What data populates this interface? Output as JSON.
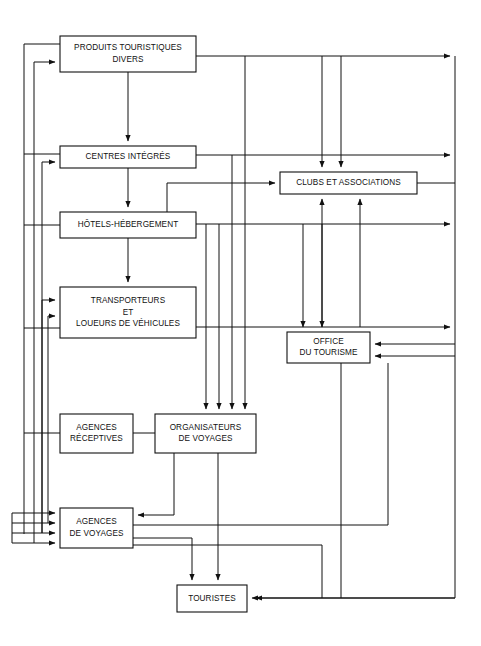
{
  "diagram": {
    "type": "flowchart",
    "background_color": "#ffffff",
    "line_color": "#111111",
    "box_fill": "#ffffff",
    "nodes": [
      {
        "id": "produits",
        "lines": [
          "PRODUITS TOURISTIQUES",
          "DIVERS"
        ],
        "x": 60,
        "y": 36,
        "w": 136,
        "h": 36
      },
      {
        "id": "centres",
        "lines": [
          "CENTRES INTÉGRÉS"
        ],
        "x": 60,
        "y": 146,
        "w": 136,
        "h": 22
      },
      {
        "id": "hotels",
        "lines": [
          "HÔTELS-HÉBERGEMENT"
        ],
        "x": 60,
        "y": 212,
        "w": 136,
        "h": 26
      },
      {
        "id": "transporteurs",
        "lines": [
          "TRANSPORTEURS",
          "ET",
          "LOUEURS DE VÉHICULES"
        ],
        "x": 60,
        "y": 287,
        "w": 136,
        "h": 51
      },
      {
        "id": "clubs",
        "lines": [
          "CLUBS ET ASSOCIATIONS"
        ],
        "x": 280,
        "y": 172,
        "w": 137,
        "h": 22
      },
      {
        "id": "office",
        "lines": [
          "OFFICE",
          "DU TOURISME"
        ],
        "x": 287,
        "y": 332,
        "w": 83,
        "h": 31
      },
      {
        "id": "receptives",
        "lines": [
          "AGENCES",
          "RÉCEPTIVES"
        ],
        "x": 60,
        "y": 414,
        "w": 73,
        "h": 39
      },
      {
        "id": "organisateurs",
        "lines": [
          "ORGANISATEURS",
          "DE VOYAGES"
        ],
        "x": 155,
        "y": 414,
        "w": 101,
        "h": 39
      },
      {
        "id": "agences",
        "lines": [
          "AGENCES",
          "DE VOYAGES"
        ],
        "x": 60,
        "y": 508,
        "w": 73,
        "h": 40
      },
      {
        "id": "touristes",
        "lines": [
          "TOURISTES"
        ],
        "x": 177,
        "y": 585,
        "w": 70,
        "h": 27
      }
    ],
    "connectors": [
      {
        "name": "produits-to-centres",
        "d": "M128,72 L128,141",
        "arrow": "end"
      },
      {
        "name": "centres-to-hotels",
        "d": "M128,168 L128,207",
        "arrow": "end"
      },
      {
        "name": "hotels-to-transporteurs",
        "d": "M128,238 L128,282",
        "arrow": "end"
      },
      {
        "name": "left-outer-bus-from-produits",
        "d": "M60,44 L24,44 L24,534",
        "arrow": "none"
      },
      {
        "name": "left-bus-centres-tap",
        "d": "M60,154 L24,154",
        "arrow": "none"
      },
      {
        "name": "left-bus-hotels-tap",
        "d": "M60,225 L24,225",
        "arrow": "none"
      },
      {
        "name": "left-bus-transporteurs-tap",
        "d": "M60,328 L24,328",
        "arrow": "none"
      },
      {
        "name": "left-bus-receptives-tap",
        "d": "M60,433 L24,433",
        "arrow": "none"
      },
      {
        "name": "left-inner-riser-to-produits",
        "d": "M34,543 L34,62 L55,62",
        "arrow": "end"
      },
      {
        "name": "left-inner-riser-to-centres",
        "d": "M42,533 L42,162 L55,162",
        "arrow": "end"
      },
      {
        "name": "left-inner-riser-to-transport-a",
        "d": "M42,533 L42,300 L55,300",
        "arrow": "end"
      },
      {
        "name": "left-inner-riser-to-transport-b",
        "d": "M48,523 L48,316 L55,316",
        "arrow": "end"
      },
      {
        "name": "agences-in-1",
        "d": "M12,513 L55,513",
        "arrow": "end"
      },
      {
        "name": "agences-in-2",
        "d": "M12,523 L55,523",
        "arrow": "end"
      },
      {
        "name": "agences-in-3",
        "d": "M12,533 L55,533",
        "arrow": "end"
      },
      {
        "name": "agences-in-4",
        "d": "M12,543 L55,543",
        "arrow": "end"
      },
      {
        "name": "agences-left-feed-riser",
        "d": "M12,513 L12,543",
        "arrow": "none"
      },
      {
        "name": "produits-right-to-far-right",
        "d": "M196,56 L450,56",
        "arrow": "end"
      },
      {
        "name": "centres-right-to-far-right",
        "d": "M196,155 L450,155",
        "arrow": "end"
      },
      {
        "name": "hotels-right-to-far-right",
        "d": "M196,224 L450,224",
        "arrow": "end"
      },
      {
        "name": "transporteurs-right-to-far-right",
        "d": "M196,327 L450,327",
        "arrow": "end"
      },
      {
        "name": "far-right-bus",
        "d": "M455,56 L455,598 L256,598",
        "arrow": "end"
      },
      {
        "name": "to-clubs-from-left-elbow",
        "d": "M167,183 L275,183",
        "arrow": "end"
      },
      {
        "name": "clubs-left-elbow-riser",
        "d": "M167,183 L167,224",
        "arrow": "none"
      },
      {
        "name": "down-into-clubs-a",
        "d": "M322,56 L322,167",
        "arrow": "end"
      },
      {
        "name": "down-into-clubs-b",
        "d": "M341,56 L341,167",
        "arrow": "end"
      },
      {
        "name": "up-into-clubs-a",
        "d": "M322,327 L322,199",
        "arrow": "end"
      },
      {
        "name": "up-into-clubs-b",
        "d": "M360,327 L360,199",
        "arrow": "end"
      },
      {
        "name": "down-into-office-a",
        "d": "M303,224 L303,327",
        "arrow": "end"
      },
      {
        "name": "down-into-office-b",
        "d": "M322,224 L322,327",
        "arrow": "end"
      },
      {
        "name": "office-in-right-a",
        "d": "M455,344 L375,344",
        "arrow": "end"
      },
      {
        "name": "office-in-right-b",
        "d": "M455,356 L375,356",
        "arrow": "end"
      },
      {
        "name": "clubs-right-down-bus",
        "d": "M417,183 L455,183",
        "arrow": "none"
      },
      {
        "name": "bus-to-organisateurs-1",
        "d": "M206,338 L206,409",
        "arrow": "end"
      },
      {
        "name": "bus-to-organisateurs-2",
        "d": "M219,338 L219,409",
        "arrow": "end"
      },
      {
        "name": "bus-to-organisateurs-3",
        "d": "M232,338 L232,409",
        "arrow": "end"
      },
      {
        "name": "bus-to-organisateurs-4",
        "d": "M245,338 L245,409",
        "arrow": "end"
      },
      {
        "name": "feed-org-1-top",
        "d": "M206,338 L206,224",
        "arrow": "none"
      },
      {
        "name": "feed-org-2-top",
        "d": "M219,224 L219,338",
        "arrow": "none"
      },
      {
        "name": "feed-org-3-top",
        "d": "M232,155 L232,338",
        "arrow": "none"
      },
      {
        "name": "feed-org-4-top",
        "d": "M245,56 L245,338",
        "arrow": "none"
      },
      {
        "name": "receptives-to-organisateurs",
        "d": "M133,433 L155,433",
        "arrow": "none"
      },
      {
        "name": "organisateurs-to-agences",
        "d": "M174,453 L174,515 L138,515",
        "arrow": "end"
      },
      {
        "name": "organisateurs-to-touristes",
        "d": "M218,453 L218,580",
        "arrow": "end"
      },
      {
        "name": "agences-to-touristes",
        "d": "M133,538 L192,538 L192,580",
        "arrow": "end"
      },
      {
        "name": "agences-right-bus-a",
        "d": "M133,525 L388,525",
        "arrow": "none"
      },
      {
        "name": "agences-right-bus-b",
        "d": "M133,545 L322,545",
        "arrow": "none"
      },
      {
        "name": "agences-bus-a-riser",
        "d": "M388,525 L388,363",
        "arrow": "none"
      },
      {
        "name": "agences-bus-b-riser",
        "d": "M322,545 L322,598",
        "arrow": "none"
      },
      {
        "name": "office-down-bus",
        "d": "M341,363 L341,598",
        "arrow": "none"
      },
      {
        "name": "touristes-in-right",
        "d": "M455,598 L252,598",
        "arrow": "end"
      }
    ]
  }
}
